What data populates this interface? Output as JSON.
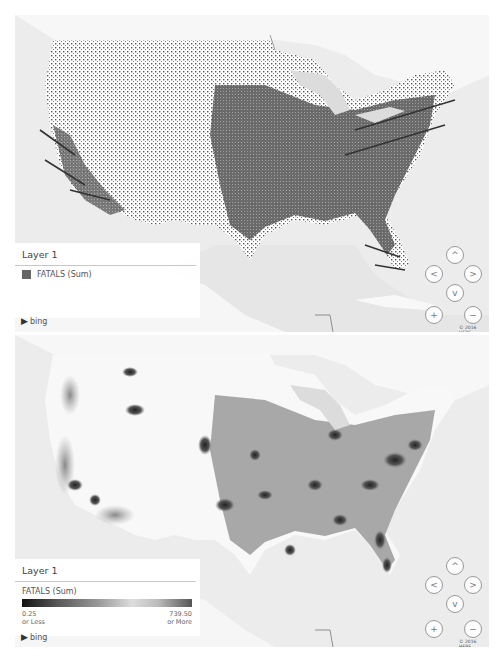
{
  "maps": [
    {
      "id": "points-map",
      "legend": {
        "layer_title": "Layer 1",
        "field_label": "FATALS (Sum)",
        "swatch_color": "#666666"
      },
      "attribution": "bing",
      "copyright": "© 2016 HERE",
      "nav": {
        "up": "^",
        "left": "<",
        "right": ">",
        "down": "v",
        "zoom_in": "+",
        "zoom_out": "−"
      }
    },
    {
      "id": "heatmap-map",
      "legend": {
        "layer_title": "Layer 1",
        "field_label": "FATALS (Sum)",
        "min_value": "0.25",
        "min_caption": "or Less",
        "max_value": "739.50",
        "max_caption": "or More"
      },
      "attribution": "bing",
      "copyright": "© 2016 HERE",
      "nav": {
        "up": "^",
        "left": "<",
        "right": ">",
        "down": "v",
        "zoom_in": "+",
        "zoom_out": "−"
      }
    }
  ]
}
